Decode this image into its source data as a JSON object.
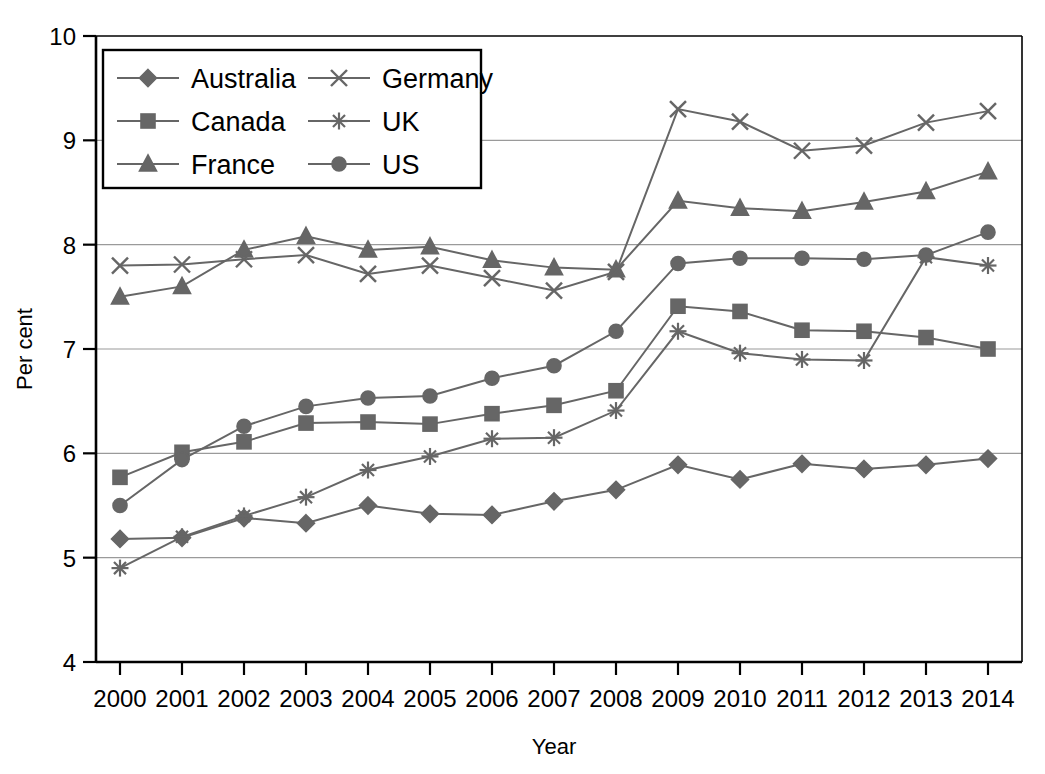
{
  "chart_data": {
    "type": "line",
    "title": "",
    "xlabel": "Year",
    "ylabel": "Per cent",
    "categories": [
      "2000",
      "2001",
      "2002",
      "2003",
      "2004",
      "2005",
      "2006",
      "2007",
      "2008",
      "2009",
      "2010",
      "2011",
      "2012",
      "2013",
      "2014"
    ],
    "x": [
      2000,
      2001,
      2002,
      2003,
      2004,
      2005,
      2006,
      2007,
      2008,
      2009,
      2010,
      2011,
      2012,
      2013,
      2014
    ],
    "xlim": [
      2000,
      2014
    ],
    "ylim": [
      4,
      10
    ],
    "y_ticks": [
      "4",
      "5",
      "6",
      "7",
      "8",
      "9",
      "10"
    ],
    "grid": true,
    "legend_position": "top-left",
    "series": [
      {
        "name": "Australia",
        "marker": "diamond",
        "values": [
          5.18,
          5.19,
          5.38,
          5.33,
          5.5,
          5.42,
          5.41,
          5.54,
          5.65,
          5.89,
          5.75,
          5.9,
          5.85,
          5.89,
          5.95
        ]
      },
      {
        "name": "Canada",
        "marker": "square",
        "values": [
          5.77,
          6.01,
          6.11,
          6.29,
          6.3,
          6.28,
          6.38,
          6.46,
          6.6,
          7.41,
          7.36,
          7.18,
          7.17,
          7.11,
          7.0
        ]
      },
      {
        "name": "France",
        "marker": "triangle",
        "values": [
          7.5,
          7.6,
          7.95,
          8.08,
          7.95,
          7.98,
          7.85,
          7.78,
          7.76,
          8.42,
          8.35,
          8.32,
          8.41,
          8.51,
          8.7
        ]
      },
      {
        "name": "Germany",
        "marker": "x",
        "values": [
          7.8,
          7.81,
          7.86,
          7.9,
          7.72,
          7.8,
          7.68,
          7.56,
          7.74,
          9.3,
          9.18,
          8.9,
          8.95,
          9.17,
          9.28
        ]
      },
      {
        "name": "UK",
        "marker": "asterisk",
        "values": [
          4.9,
          5.2,
          5.4,
          5.58,
          5.84,
          5.97,
          6.14,
          6.15,
          6.41,
          7.17,
          6.96,
          6.9,
          6.89,
          7.88,
          7.8
        ]
      },
      {
        "name": "US",
        "marker": "circle",
        "values": [
          5.5,
          5.94,
          6.26,
          6.45,
          6.53,
          6.55,
          6.72,
          6.84,
          7.17,
          7.82,
          7.87,
          7.87,
          7.86,
          7.9,
          8.12
        ]
      }
    ]
  },
  "colors": {
    "series": "#666666",
    "grid": "#9a9a9a",
    "axis": "#000000",
    "background": "#ffffff"
  },
  "legend": {
    "entries": [
      {
        "label": "Australia",
        "marker": "diamond"
      },
      {
        "label": "Germany",
        "marker": "x"
      },
      {
        "label": "Canada",
        "marker": "square"
      },
      {
        "label": "UK",
        "marker": "asterisk"
      },
      {
        "label": "France",
        "marker": "triangle"
      },
      {
        "label": "US",
        "marker": "circle"
      }
    ]
  }
}
